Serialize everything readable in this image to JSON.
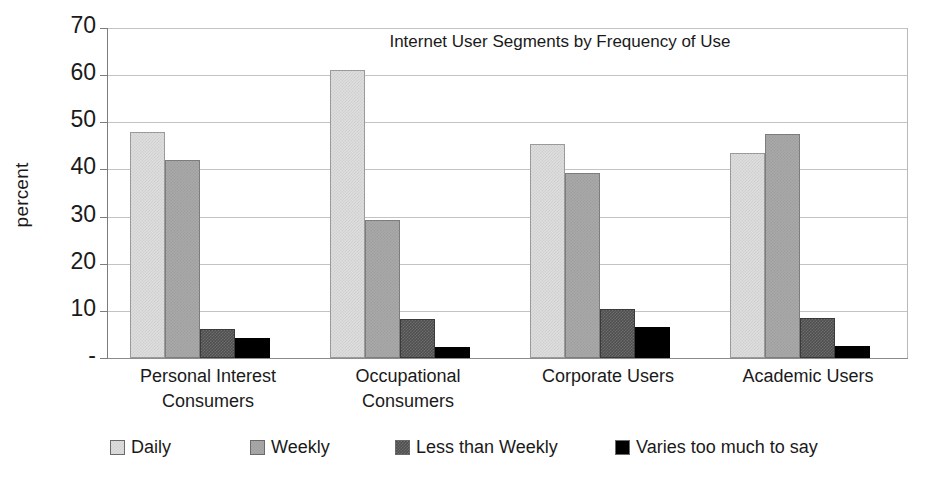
{
  "chart_data": {
    "type": "bar",
    "title": "Internet User Segments by Frequency of Use",
    "xlabel": "",
    "ylabel": "percent",
    "ylim": [
      0,
      70
    ],
    "ytick_labels": [
      "70",
      "60",
      "50",
      "40",
      "30",
      "20",
      "10",
      "-"
    ],
    "ytick_values": [
      70,
      60,
      50,
      40,
      30,
      20,
      10,
      0
    ],
    "grid": true,
    "legend_position": "bottom",
    "categories": [
      "Personal Interest Consumers",
      "Occupational Consumers",
      "Corporate Users",
      "Academic Users"
    ],
    "category_lines": [
      [
        "Personal Interest",
        "Consumers"
      ],
      [
        "Occupational",
        "Consumers"
      ],
      [
        "Corporate Users",
        ""
      ],
      [
        "Academic Users",
        ""
      ]
    ],
    "series": [
      {
        "name": "Daily",
        "color": "#dedede",
        "values": [
          48.0,
          61.2,
          45.4,
          43.5
        ]
      },
      {
        "name": "Weekly",
        "color": "#a9a9a9",
        "values": [
          42.0,
          29.2,
          39.3,
          47.5
        ]
      },
      {
        "name": "Less than Weekly",
        "color": "#4f4f4f",
        "values": [
          6.2,
          8.2,
          10.3,
          8.5
        ]
      },
      {
        "name": "Varies too much to say",
        "color": "#000000",
        "values": [
          4.3,
          2.3,
          6.6,
          2.6
        ]
      }
    ]
  },
  "axis": {
    "y_title": "percent"
  }
}
